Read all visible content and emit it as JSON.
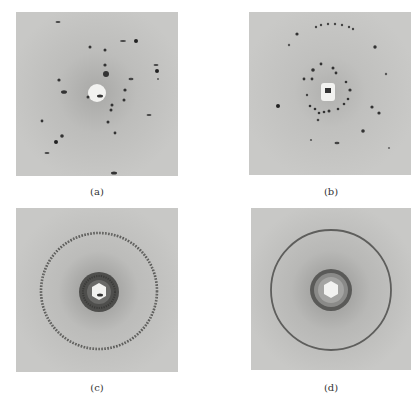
{
  "figure": {
    "panels": [
      {
        "id": "a",
        "label": "(a)",
        "description": "Laue-type single-crystal diffraction pattern with discrete spots around central beam stop",
        "pattern": "spots"
      },
      {
        "id": "b",
        "label": "(b)",
        "description": "Diffraction pattern with spots arranged in concentric rings (polycrystalline, few grains)",
        "pattern": "spotty-rings"
      },
      {
        "id": "c",
        "label": "(c)",
        "description": "Spotty Debye ring with dark inner halo around hexagonal beam stop",
        "pattern": "spotty-ring"
      },
      {
        "id": "d",
        "label": "(d)",
        "description": "Continuous smooth Debye rings (fine-grained powder) around hexagonal beam stop",
        "pattern": "continuous-rings"
      }
    ]
  },
  "colors": {
    "background": "#ffffff",
    "film": "#c4c4c2",
    "spot": "#2a2a2a",
    "ring": "#555555",
    "beamstop": "#f2f2f0"
  }
}
